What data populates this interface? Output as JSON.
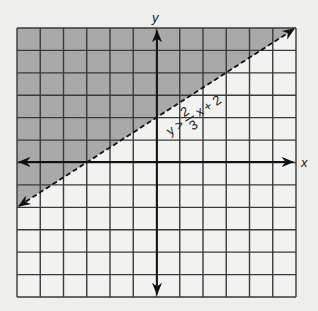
{
  "graph": {
    "x_axis_label": "x",
    "y_axis_label": "y",
    "x_range": [
      -6,
      6
    ],
    "y_range": [
      -6,
      6
    ],
    "grid_step": 1,
    "inequality": {
      "lhs": "y",
      "operator": ">",
      "slope_numerator": "2",
      "slope_denominator": "3",
      "variable": "x",
      "intercept_text": "+ 2",
      "full_text": "y > 2/3 x + 2",
      "boundary": "dashed",
      "shaded_region": "above"
    },
    "colors": {
      "background": "#eeeeec",
      "shade": "#a9a9a9",
      "grid": "#3a3a3a",
      "axis": "#111111"
    }
  },
  "chart_data": {
    "type": "line",
    "title": "",
    "xlabel": "x",
    "ylabel": "y",
    "xlim": [
      -6,
      6
    ],
    "ylim": [
      -6,
      6
    ],
    "grid": true,
    "series": [
      {
        "name": "y > 2/3 x + 2",
        "style": "dashed",
        "x": [
          -6,
          6
        ],
        "y": [
          -2,
          6
        ],
        "shaded": "above"
      }
    ],
    "annotations": [
      "y > 2/3 x + 2"
    ]
  }
}
